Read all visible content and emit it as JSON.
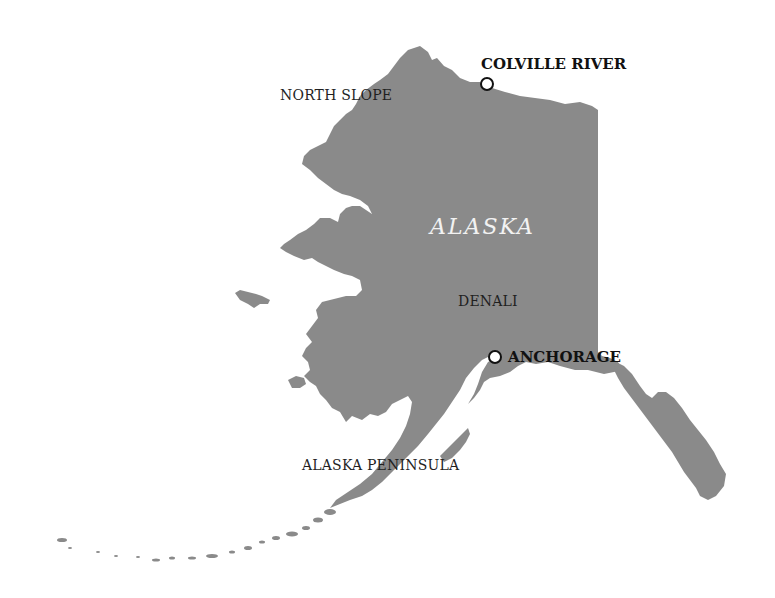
{
  "map": {
    "state_name": "ALASKA",
    "land_color": "#8a8a8a",
    "water_color": "#ffffff",
    "regions": [
      {
        "name": "NORTH SLOPE"
      },
      {
        "name": "DENALI"
      },
      {
        "name": "ALASKA PENINSULA"
      }
    ],
    "cities": [
      {
        "name": "COLVILLE RIVER",
        "marker": "circle-marker"
      },
      {
        "name": "ANCHORAGE",
        "marker": "circle-marker"
      }
    ]
  }
}
